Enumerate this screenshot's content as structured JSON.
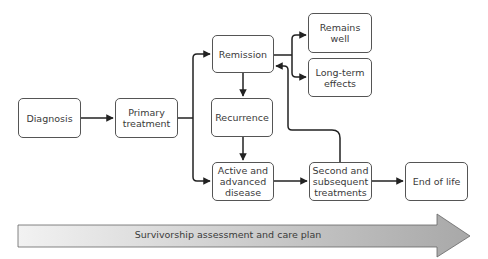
{
  "diagram": {
    "nodes": {
      "diagnosis": "Diagnosis",
      "primary_treatment": "Primary\ntreatment",
      "remission": "Remission",
      "recurrence": "Recurrence",
      "active_advanced": "Active and\nadvanced\ndisease",
      "remains_well": "Remains\nwell",
      "long_term_effects": "Long-term\neffects",
      "second_subsequent": "Second and\nsubsequent\ntreatments",
      "end_of_life": "End of life"
    },
    "edges": [
      {
        "from": "diagnosis",
        "to": "primary_treatment"
      },
      {
        "from": "primary_treatment",
        "to": "remission"
      },
      {
        "from": "primary_treatment",
        "to": "active_advanced"
      },
      {
        "from": "remission",
        "to": "recurrence"
      },
      {
        "from": "remission",
        "to": "remains_well"
      },
      {
        "from": "remission",
        "to": "long_term_effects"
      },
      {
        "from": "recurrence",
        "to": "active_advanced"
      },
      {
        "from": "active_advanced",
        "to": "second_subsequent"
      },
      {
        "from": "second_subsequent",
        "to": "remission"
      },
      {
        "from": "second_subsequent",
        "to": "end_of_life"
      }
    ],
    "banner": "Survivorship assessment and care plan",
    "colors": {
      "line": "#222222",
      "box_border": "#555555",
      "banner_light": "#f2f2f2",
      "banner_dark": "#a8a8a8"
    }
  }
}
